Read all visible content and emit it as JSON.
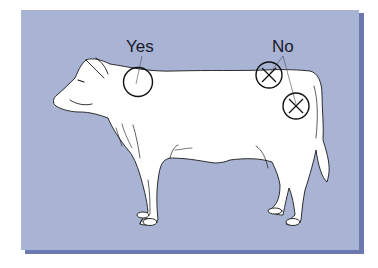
{
  "figure": {
    "labels": {
      "yes": "Yes",
      "no": "No"
    },
    "markers": [
      {
        "type": "correct-injection-site",
        "location": "neck",
        "symbol": "circle"
      },
      {
        "type": "incorrect-injection-site",
        "location": "top-of-rump",
        "symbol": "circle-x"
      },
      {
        "type": "incorrect-injection-site",
        "location": "hindquarter",
        "symbol": "circle-x"
      }
    ]
  },
  "colors": {
    "background": "#ffffff",
    "panel": "#a9b3d3",
    "panel_shadow": "#6b79b0",
    "cow_fill": "#ffffff",
    "outline": "#1a1a1a"
  }
}
